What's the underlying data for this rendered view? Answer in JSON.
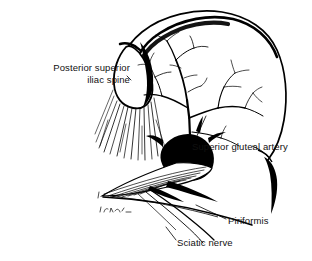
{
  "figure": {
    "type": "anatomical-line-drawing",
    "style": "black ink pen-and-hatch illustration on white background",
    "background_color": "#ffffff",
    "ink_color": "#000000"
  },
  "labels": {
    "posterior_superior_iliac_spine": {
      "line1": "Posterior superior",
      "line2": "iliac spine"
    },
    "superior_gluteal_artery": "Superior gluteal artery",
    "piriformis": "Piriformis",
    "sciatic_nerve": "Sciatic nerve"
  },
  "structures": [
    "iliac crest",
    "posterior superior iliac spine",
    "greater sciatic notch",
    "superior gluteal artery with branching tree",
    "piriformis muscle",
    "sciatic nerve",
    "ischial spine",
    "artist signature"
  ]
}
